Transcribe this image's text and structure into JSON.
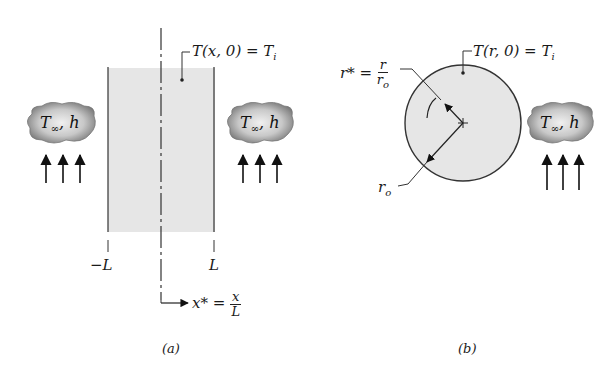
{
  "figure_a": {
    "caption": "(a)",
    "initial_condition": "T(x, 0) = T",
    "initial_condition_sub": "i",
    "left_boundary_label": "−L",
    "right_boundary_label": "L",
    "coordinate_label_lhs": "x* =",
    "coordinate_num": "x",
    "coordinate_den": "L",
    "left_fluid": {
      "t": "T",
      "sub": "∞",
      "h": ", h"
    },
    "right_fluid": {
      "t": "T",
      "sub": "∞",
      "h": ", h"
    }
  },
  "figure_b": {
    "caption": "(b)",
    "initial_condition": "T(r, 0) = T",
    "initial_condition_sub": "i",
    "radius_coord_lhs": "r* =",
    "radius_num": "r",
    "radius_den": "r",
    "radius_den_sub": "o",
    "outer_radius_label": "r",
    "outer_radius_sub": "o",
    "fluid": {
      "t": "T",
      "sub": "∞",
      "h": ", h"
    }
  },
  "colors": {
    "solid_fill": "#e6e6e6",
    "cloud_fill": "#9a9a9a",
    "line": "#222222"
  }
}
